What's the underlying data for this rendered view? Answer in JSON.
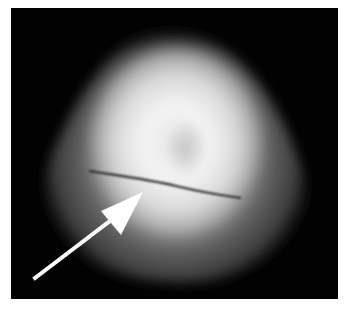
{
  "image": {
    "description": "Grayscale transillumination photo of a rounded, glowing specimen with a dark horizontal crack line; a white arrow points to the crack.",
    "background_color": "#020202",
    "border_color": "#ffffff",
    "annotation": {
      "type": "arrow",
      "color": "#ffffff",
      "target": "crack-line"
    }
  }
}
